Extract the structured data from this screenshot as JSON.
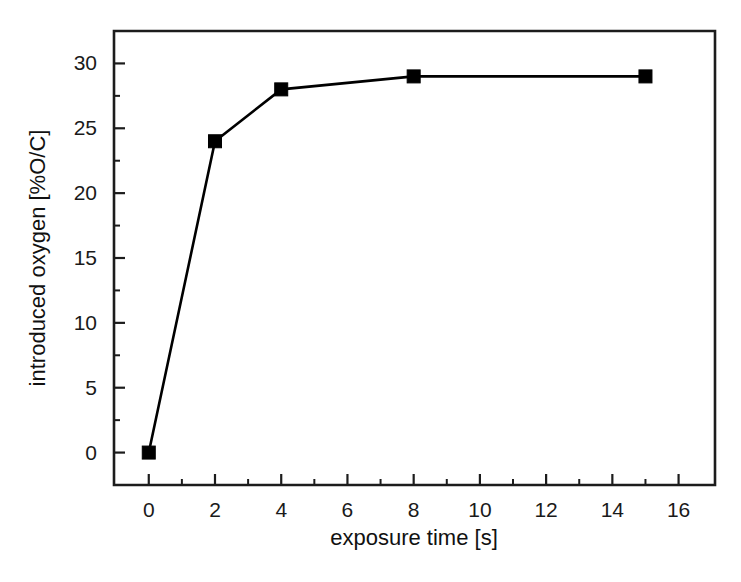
{
  "chart_data": {
    "type": "line",
    "title": "",
    "subtitle": "",
    "xlabel": "exposure time [s]",
    "ylabel": "introduced oxygen [%O/C]",
    "x": [
      0,
      2,
      4,
      8,
      15
    ],
    "values": [
      0,
      24,
      28,
      29,
      29
    ],
    "series": [
      {
        "name": "introduced oxygen",
        "x": [
          0,
          2,
          4,
          8,
          15
        ],
        "values": [
          0,
          24,
          28,
          29,
          29
        ],
        "marker": "filled-square",
        "color": "#000000",
        "line_color": "#000000"
      }
    ],
    "xlim": [
      -1.05,
      17.1
    ],
    "ylim": [
      -2.5,
      32.5
    ],
    "xticks": [
      0,
      2,
      4,
      6,
      8,
      10,
      12,
      14,
      16
    ],
    "xtick_labels": [
      "0",
      "2",
      "4",
      "6",
      "8",
      "10",
      "12",
      "14",
      "16"
    ],
    "xticks_minor": [
      1,
      3,
      5,
      7,
      9,
      11,
      13,
      15
    ],
    "yticks": [
      0,
      5,
      10,
      15,
      20,
      25,
      30
    ],
    "ytick_labels": [
      "0",
      "5",
      "10",
      "15",
      "20",
      "25",
      "30"
    ],
    "yticks_minor": [
      2.5,
      7.5,
      12.5,
      17.5,
      22.5,
      27.5
    ],
    "grid": false,
    "legend": null,
    "legend_position": "none",
    "annotations": [],
    "frame": "full-box",
    "tick_direction": "in",
    "background_color": "#ffffff",
    "axis_color": "#1c1c1c"
  },
  "axes": {
    "x_axis_title": "exposure time [s]",
    "y_axis_title": "introduced oxygen [%O/C]"
  }
}
